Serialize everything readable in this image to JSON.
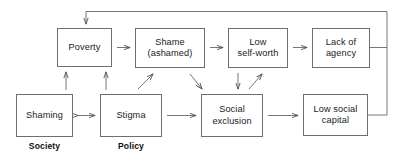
{
  "diagram": {
    "canvas": {
      "width": 402,
      "height": 163,
      "background": "#ffffff"
    },
    "stroke_color": "#6e6e6e",
    "text_color": "#1a1a1a",
    "nodes": [
      {
        "id": "poverty",
        "label": "Poverty",
        "x": 57,
        "y": 28,
        "w": 55,
        "h": 39
      },
      {
        "id": "shame",
        "label": "Shame\n(ashamed)",
        "x": 135,
        "y": 28,
        "w": 70,
        "h": 40
      },
      {
        "id": "low-self-worth",
        "label": "Low\nself-worth",
        "x": 228,
        "y": 28,
        "w": 60,
        "h": 40
      },
      {
        "id": "lack-of-agency",
        "label": "Lack of\nagency",
        "x": 312,
        "y": 28,
        "w": 58,
        "h": 40
      },
      {
        "id": "shaming",
        "label": "Shaming",
        "x": 16,
        "y": 94,
        "w": 57,
        "h": 43
      },
      {
        "id": "stigma",
        "label": "Stigma",
        "x": 100,
        "y": 94,
        "w": 62,
        "h": 43
      },
      {
        "id": "social-exclusion",
        "label": "Social\nexclusion",
        "x": 201,
        "y": 94,
        "w": 62,
        "h": 43
      },
      {
        "id": "low-social-capital",
        "label": "Low social\ncapital",
        "x": 303,
        "y": 94,
        "w": 65,
        "h": 42
      }
    ],
    "group_labels": [
      {
        "id": "society",
        "label": "Society",
        "x": 16,
        "y": 141,
        "w": 57
      },
      {
        "id": "policy",
        "label": "Policy",
        "x": 100,
        "y": 141,
        "w": 62
      }
    ],
    "edges": [
      {
        "id": "poverty-to-shame",
        "from": "poverty",
        "to": "shame",
        "kind": "arrow-right"
      },
      {
        "id": "shame-to-low-self-worth",
        "from": "shame",
        "to": "low-self-worth",
        "kind": "arrow-right"
      },
      {
        "id": "low-self-worth-to-lack-of-agency",
        "from": "low-self-worth",
        "to": "lack-of-agency",
        "kind": "arrow-right"
      },
      {
        "id": "shaming-to-poverty",
        "from": "shaming",
        "to": "poverty",
        "kind": "arrow-up"
      },
      {
        "id": "stigma-to-poverty",
        "from": "stigma",
        "to": "poverty",
        "kind": "arrow-up"
      },
      {
        "id": "stigma-to-shame",
        "from": "stigma",
        "to": "shame",
        "kind": "arrow-diagonal-up-right"
      },
      {
        "id": "shame-to-social-exclusion",
        "from": "shame",
        "to": "social-exclusion",
        "kind": "arrow-diagonal-down-right"
      },
      {
        "id": "low-self-worth-to-social-exclusion",
        "from": "low-self-worth",
        "to": "social-exclusion",
        "kind": "arrow-down"
      },
      {
        "id": "social-exclusion-to-low-self-worth",
        "from": "social-exclusion",
        "to": "low-self-worth",
        "kind": "arrow-diagonal-up-right"
      },
      {
        "id": "shaming-stigma-bidirectional",
        "from": "shaming",
        "to": "stigma",
        "kind": "arrow-double"
      },
      {
        "id": "stigma-to-social-exclusion",
        "from": "stigma",
        "to": "social-exclusion",
        "kind": "arrow-right-long"
      },
      {
        "id": "social-exclusion-to-low-social-capital",
        "from": "social-exclusion",
        "to": "low-social-capital",
        "kind": "arrow-right-long"
      },
      {
        "id": "feedback-to-poverty",
        "from": "lack-of-agency",
        "to": "poverty",
        "kind": "feedback-loop"
      },
      {
        "id": "low-social-capital-to-feedback",
        "from": "low-social-capital",
        "to": "feedback-loop",
        "kind": "connector"
      }
    ]
  }
}
